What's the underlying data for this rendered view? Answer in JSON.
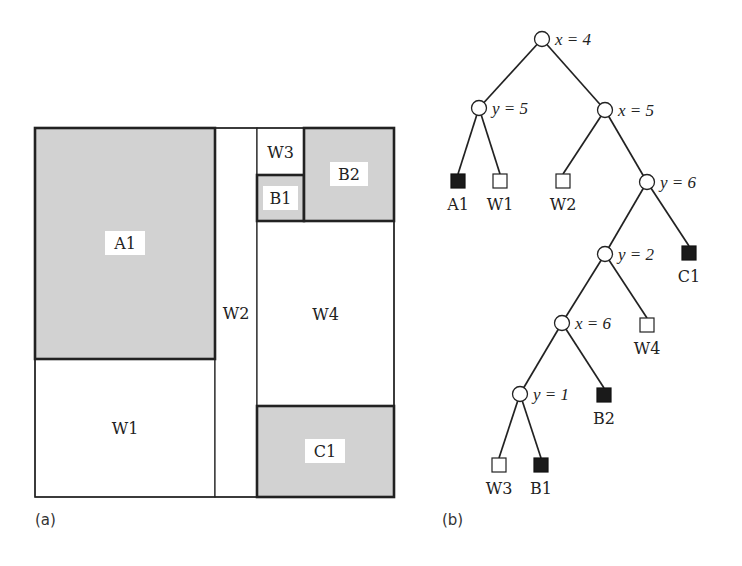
{
  "colors": {
    "shaded": "#d2d2d2",
    "line": "#222222",
    "leaf_filled": "#1a1a1a",
    "leaf_empty": "#ffffff"
  },
  "panel_a": {
    "caption": "(a)",
    "regions": [
      {
        "id": "A1",
        "label": "A1",
        "shaded": true,
        "x": 35,
        "y": 128,
        "w": 180,
        "h": 231,
        "lx": 105,
        "ly": 231,
        "lw": 40,
        "lh": 24
      },
      {
        "id": "W1",
        "label": "W1",
        "shaded": false,
        "x": 35,
        "y": 359,
        "w": 180,
        "h": 138
      },
      {
        "id": "W2",
        "label": "W2",
        "shaded": false,
        "x": 215,
        "y": 128,
        "w": 42,
        "h": 369
      },
      {
        "id": "W3",
        "label": "W3",
        "shaded": false,
        "x": 257,
        "y": 128,
        "w": 47,
        "h": 47
      },
      {
        "id": "B1",
        "label": "B1",
        "shaded": true,
        "x": 257,
        "y": 175,
        "w": 47,
        "h": 46,
        "lx": 263,
        "ly": 186,
        "lw": 35,
        "lh": 24
      },
      {
        "id": "B2",
        "label": "B2",
        "shaded": true,
        "x": 304,
        "y": 128,
        "w": 90,
        "h": 93,
        "lx": 330,
        "ly": 162,
        "lw": 38,
        "lh": 24
      },
      {
        "id": "W4",
        "label": "W4",
        "shaded": false,
        "x": 257,
        "y": 221,
        "w": 137,
        "h": 185
      },
      {
        "id": "C1",
        "label": "C1",
        "shaded": true,
        "x": 257,
        "y": 406,
        "w": 137,
        "h": 91,
        "lx": 305,
        "ly": 439,
        "lw": 40,
        "lh": 24
      }
    ]
  },
  "panel_b": {
    "caption": "(b)",
    "nodes": [
      {
        "id": "n0",
        "x": 542,
        "y": 39,
        "label": "x = 4"
      },
      {
        "id": "n1",
        "x": 479,
        "y": 108,
        "label": "y = 5"
      },
      {
        "id": "n2",
        "x": 605,
        "y": 110,
        "label": "x = 5"
      },
      {
        "id": "n3",
        "x": 647,
        "y": 182,
        "label": "y = 6"
      },
      {
        "id": "n4",
        "x": 605,
        "y": 254,
        "label": "y = 2"
      },
      {
        "id": "n5",
        "x": 562,
        "y": 323,
        "label": "x = 6"
      },
      {
        "id": "n6",
        "x": 520,
        "y": 394,
        "label": "y = 1"
      }
    ],
    "leaves": [
      {
        "id": "A1",
        "x": 458,
        "y": 181,
        "filled": true,
        "label": "A1"
      },
      {
        "id": "W1",
        "x": 500,
        "y": 181,
        "filled": false,
        "label": "W1"
      },
      {
        "id": "W2",
        "x": 563,
        "y": 181,
        "filled": false,
        "label": "W2"
      },
      {
        "id": "C1",
        "x": 689,
        "y": 253,
        "filled": true,
        "label": "C1"
      },
      {
        "id": "W4",
        "x": 647,
        "y": 325,
        "filled": false,
        "label": "W4"
      },
      {
        "id": "B2",
        "x": 604,
        "y": 395,
        "filled": true,
        "label": "B2"
      },
      {
        "id": "W3",
        "x": 499,
        "y": 465,
        "filled": false,
        "label": "W3"
      },
      {
        "id": "B1",
        "x": 541,
        "y": 465,
        "filled": true,
        "label": "B1"
      }
    ],
    "edges": [
      [
        "n0",
        "n1"
      ],
      [
        "n0",
        "n2"
      ],
      [
        "n1",
        "A1"
      ],
      [
        "n1",
        "W1"
      ],
      [
        "n2",
        "W2"
      ],
      [
        "n2",
        "n3"
      ],
      [
        "n3",
        "n4"
      ],
      [
        "n3",
        "C1"
      ],
      [
        "n4",
        "n5"
      ],
      [
        "n4",
        "W4"
      ],
      [
        "n5",
        "n6"
      ],
      [
        "n5",
        "B2"
      ],
      [
        "n6",
        "W3"
      ],
      [
        "n6",
        "B1"
      ]
    ]
  }
}
